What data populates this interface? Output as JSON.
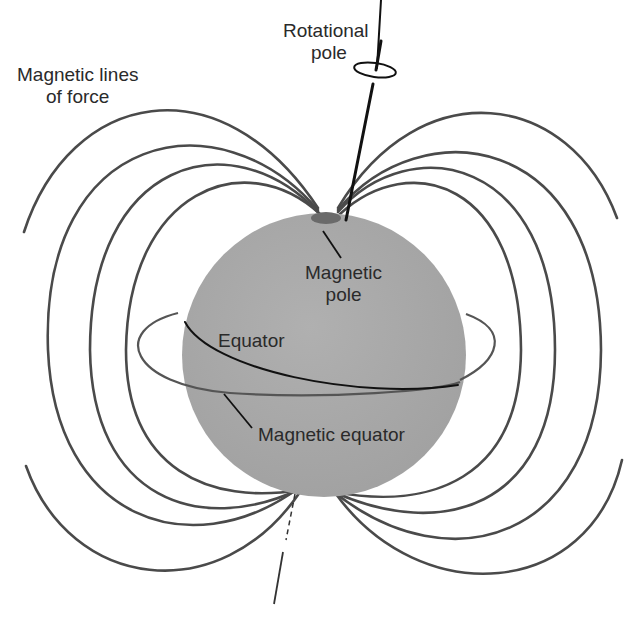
{
  "diagram": {
    "type": "labeled scientific illustration",
    "colors": {
      "sphere": "#a8a8a8",
      "field_lines": "#4a4a4a",
      "axis": "#111111",
      "pole_cap": "#6a6a6a",
      "background": "#ffffff"
    },
    "labels": {
      "field_lines": {
        "line1": "Magnetic lines",
        "line2": "of force"
      },
      "rotational_pole": {
        "line1": "Rotational",
        "line2": "pole"
      },
      "magnetic_pole": {
        "line1": "Magnetic",
        "line2": "pole"
      },
      "equator": "Equator",
      "magnetic_equator": "Magnetic equator"
    }
  }
}
